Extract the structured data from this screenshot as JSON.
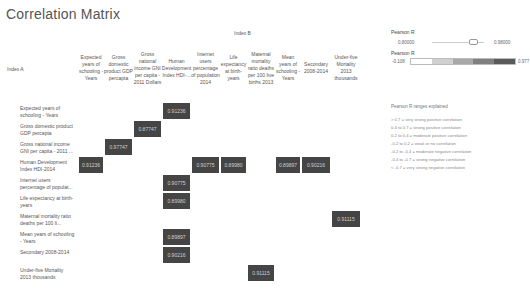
{
  "title": "Correlation Matrix",
  "axis": {
    "index_b": "Index B",
    "index_a": "Index A"
  },
  "columns": [
    {
      "label": "Expected years of schooling - Years",
      "x": 78,
      "w": 26
    },
    {
      "label": "Gross domestic product GDP percapta",
      "x": 104,
      "w": 29
    },
    {
      "label": "Gross national income GNI per capita - 2011 Dollars",
      "x": 133,
      "w": 29
    },
    {
      "label": "Human Development Index HDI-...",
      "x": 162,
      "w": 29
    },
    {
      "label": "Internet users percentage of population 2014",
      "x": 191,
      "w": 29
    },
    {
      "label": "Life expectancy at birth- years",
      "x": 220,
      "w": 27
    },
    {
      "label": "Maternal mortality ratio deaths per 100 live births 2013",
      "x": 247,
      "w": 28
    },
    {
      "label": "Mean years of schooling - Years",
      "x": 275,
      "w": 26
    },
    {
      "label": "Secondary 2008-2014",
      "x": 301,
      "w": 30
    },
    {
      "label": "Under-five Mortality 2013 thousands",
      "x": 331,
      "w": 30
    }
  ],
  "rows": [
    {
      "label": "Expected years of schooling - Years",
      "y": 102
    },
    {
      "label": "Gross domestic product GDP percapta",
      "y": 120
    },
    {
      "label": "Gross national income GNI per capita - 2011 ...",
      "y": 138
    },
    {
      "label": "Human Development Index HDI-2014",
      "y": 156
    },
    {
      "label": "Internet users percentage of populat...",
      "y": 174
    },
    {
      "label": "Life expectancy at birth- years",
      "y": 192
    },
    {
      "label": "Maternal mortality ratio deaths per 100 li...",
      "y": 210
    },
    {
      "label": "Mean years of schooling - Years",
      "y": 228
    },
    {
      "label": "Secondary 2008-2014",
      "y": 246
    },
    {
      "label": "Under-five Mortality 2013 thousands",
      "y": 264
    }
  ],
  "cells": [
    {
      "row": 0,
      "col": 3,
      "value": "0.91236"
    },
    {
      "row": 1,
      "col": 2,
      "value": "0.87747"
    },
    {
      "row": 2,
      "col": 1,
      "value": "0.97747"
    },
    {
      "row": 3,
      "col": 0,
      "value": "0.91236"
    },
    {
      "row": 3,
      "col": 4,
      "value": "0.90775"
    },
    {
      "row": 3,
      "col": 5,
      "value": "0.89980"
    },
    {
      "row": 3,
      "col": 7,
      "value": "0.89897"
    },
    {
      "row": 3,
      "col": 8,
      "value": "0.90216"
    },
    {
      "row": 4,
      "col": 3,
      "value": "0.90775"
    },
    {
      "row": 5,
      "col": 3,
      "value": "0.89980"
    },
    {
      "row": 6,
      "col": 9,
      "value": "0.91115"
    },
    {
      "row": 7,
      "col": 3,
      "value": "0.89897"
    },
    {
      "row": 8,
      "col": 3,
      "value": "0.90216"
    },
    {
      "row": 9,
      "col": 6,
      "value": "0.91115"
    }
  ],
  "filter": {
    "title": "Pearson R",
    "min_value": "0.80000",
    "max_value": "0.98000"
  },
  "color_legend": {
    "title": "Pearson R",
    "min": "-0.108",
    "max": "0.977",
    "colors": [
      "#ffffff",
      "#d0d0d0",
      "#a8a8a8",
      "#808080",
      "#5a5a5a"
    ]
  },
  "explanation": {
    "title": "Pearson R ranges explained",
    "lines": [
      "> 0.7 = very strong positive correlation",
      "0.4 to 0.7 = strong positive correlation",
      "0.2 to 0.4 = moderate positive correlation",
      "-0.2 to 0.2 = weak or no correlation",
      "-0.2 to -0.4 = moderate negative correlation",
      "-0.4 to -0.7 = strong negative correlation",
      "< -0.7 = very strong negative correlation"
    ]
  },
  "cell_color": "#454545"
}
